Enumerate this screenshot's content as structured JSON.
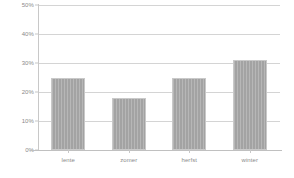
{
  "chart_data": {
    "type": "bar",
    "title": "",
    "subtitle": "",
    "xlabel": "",
    "ylabel": "",
    "categories": [
      "lente",
      "zomer",
      "herfst",
      "winter"
    ],
    "values": [
      25,
      18,
      25,
      31
    ],
    "ylim": [
      0,
      50
    ],
    "yticks": [
      0,
      10,
      20,
      30,
      40,
      50
    ],
    "ytick_labels": [
      "0%",
      "10%",
      "20%",
      "30%",
      "40%",
      "50%"
    ],
    "grid": true,
    "legend": null,
    "legend_position": "none",
    "series": [
      {
        "name": "",
        "values": [
          25,
          18,
          25,
          31
        ]
      }
    ],
    "colors": {
      "bar_fill": "#a3a3a3",
      "bar_border": "#c9c9c9",
      "gridline": "#d4d4d4",
      "axis": "#c8c8c8",
      "tick_text": "#8a8a8a",
      "background": "#ffffff"
    }
  }
}
